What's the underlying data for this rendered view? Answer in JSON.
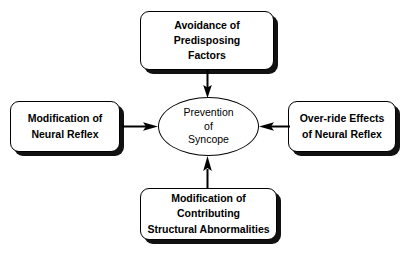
{
  "page": {
    "clipped_header_text": "",
    "background_color": "#ffffff",
    "line_color": "#000000",
    "shadow_color": "#111111"
  },
  "diagram": {
    "type": "radial-convergence",
    "center": {
      "shape": "ellipse",
      "lines": [
        "Prevention",
        "of",
        "Syncope"
      ]
    },
    "nodes": [
      {
        "id": "top",
        "position": "top",
        "shape": "rounded-rect",
        "lines": [
          "Avoidance of",
          "Predisposing",
          "Factors"
        ]
      },
      {
        "id": "left",
        "position": "left",
        "shape": "rounded-rect",
        "lines": [
          "Modification of",
          "Neural Reflex"
        ]
      },
      {
        "id": "right",
        "position": "right",
        "shape": "rounded-rect",
        "lines": [
          "Over-ride Effects",
          "of Neural Reflex"
        ]
      },
      {
        "id": "bottom",
        "position": "bottom",
        "shape": "rounded-rect",
        "lines": [
          "Modification of",
          "Contributing",
          "Structural Abnormalities"
        ]
      }
    ],
    "arrows": [
      {
        "id": "top-to-center",
        "from": "top",
        "to": "center",
        "direction": "down"
      },
      {
        "id": "left-to-center",
        "from": "left",
        "to": "center",
        "direction": "right"
      },
      {
        "id": "right-to-center",
        "from": "right",
        "to": "center",
        "direction": "left"
      },
      {
        "id": "bottom-to-center",
        "from": "bottom",
        "to": "center",
        "direction": "up"
      }
    ]
  }
}
